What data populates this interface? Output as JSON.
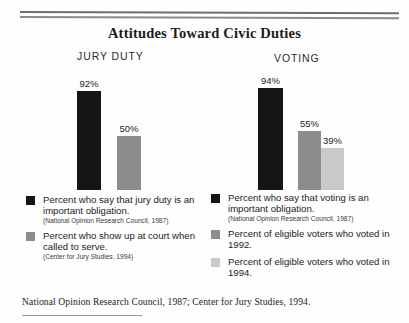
{
  "title": "Attitudes Toward Civic Duties",
  "source_note": "National Opinion Research Council, 1987; Center for Jury Studies, 1994.",
  "groups": {
    "jury_label": "JURY DUTY",
    "voting_label": "VOTING"
  },
  "colors": {
    "dark": "#151515",
    "mid": "#8d8d8d",
    "light": "#c9c9c9",
    "rule": "#6d6d6d",
    "text": "#1a1a1a"
  },
  "bars": [
    {
      "group": "JURY DUTY",
      "label": "92%",
      "value": 92,
      "color": "#151515"
    },
    {
      "group": "JURY DUTY",
      "label": "50%",
      "value": 50,
      "color": "#8d8d8d"
    },
    {
      "group": "VOTING",
      "label": "94%",
      "value": 94,
      "color": "#151515"
    },
    {
      "group": "VOTING",
      "label": "55%",
      "value": 55,
      "color": "#8d8d8d"
    },
    {
      "group": "VOTING",
      "label": "39%",
      "value": 39,
      "color": "#c9c9c9"
    }
  ],
  "legend_left": [
    {
      "swatch": "#151515",
      "text": "Percent who say that jury duty is an important obligation.",
      "cite": "(National Opinion Research Council, 1987)"
    },
    {
      "swatch": "#8d8d8d",
      "text": "Percent who show up at court when called to serve.",
      "cite": "(Center for Jury Studies, 1994)"
    }
  ],
  "legend_right": [
    {
      "swatch": "#151515",
      "text": "Percent who say that voting is an important obligation.",
      "cite": "(National Opinion Research Council, 1987)"
    },
    {
      "swatch": "#8d8d8d",
      "text": "Percent of eligible voters who voted in 1992.",
      "cite": ""
    },
    {
      "swatch": "#c9c9c9",
      "text": "Percent of eligible voters who voted in 1994.",
      "cite": ""
    }
  ],
  "chart_data": {
    "type": "bar",
    "title": "Attitudes Toward Civic Duties",
    "xlabel": "",
    "ylabel": "Percent",
    "ylim": [
      0,
      100
    ],
    "grid": false,
    "legend_position": "below",
    "categories": [
      "JURY DUTY",
      "VOTING"
    ],
    "series": [
      {
        "name": "Percent who say that it is an important obligation.",
        "values": [
          92,
          94
        ],
        "color": "#151515"
      },
      {
        "name": "Percent who show up at court when called to serve. / Percent of eligible voters who voted in 1992.",
        "values": [
          50,
          55
        ],
        "color": "#8d8d8d"
      },
      {
        "name": "Percent of eligible voters who voted in 1994.",
        "values": [
          null,
          39
        ],
        "color": "#c9c9c9"
      }
    ],
    "data_labels": [
      "92%",
      "50%",
      "94%",
      "55%",
      "39%"
    ],
    "annotations": [
      "National Opinion Research Council, 1987",
      "Center for Jury Studies, 1994"
    ]
  }
}
